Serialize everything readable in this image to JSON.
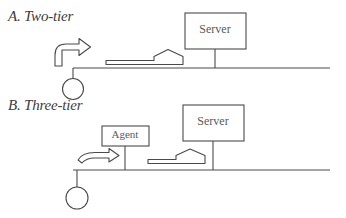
{
  "figure": {
    "background_color": "#ffffff",
    "stroke_color": "#4a4a4a",
    "text_color": "#3c3c3c",
    "panels": [
      {
        "id": "two-tier",
        "caption": "A. Two-tier",
        "nodes": [
          {
            "name": "client",
            "shape": "circle"
          },
          {
            "name": "server",
            "shape": "box",
            "label": "Server"
          }
        ],
        "arrows": [
          {
            "name": "client-uplink-arrow",
            "shape": "curved-up-right"
          },
          {
            "name": "client-to-server-arrow",
            "shape": "flat-right"
          }
        ]
      },
      {
        "id": "three-tier",
        "caption": "B. Three-tier",
        "nodes": [
          {
            "name": "client",
            "shape": "circle"
          },
          {
            "name": "agent",
            "shape": "box",
            "label": "Agent"
          },
          {
            "name": "server",
            "shape": "box",
            "label": "Server"
          }
        ],
        "arrows": [
          {
            "name": "client-to-agent-arrow",
            "shape": "flat-right"
          },
          {
            "name": "agent-to-server-arrow",
            "shape": "flat-right"
          }
        ]
      }
    ]
  },
  "labels": {
    "panel_a_caption": "A. Two-tier",
    "panel_b_caption": "B. Three-tier",
    "server_a": "Server",
    "server_b": "Server",
    "agent": "Agent"
  }
}
